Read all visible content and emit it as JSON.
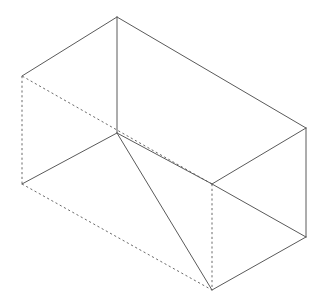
{
  "figure": {
    "background_color": "#ffffff",
    "visible_edge_color": "#5a5a5a",
    "hidden_edge_color": "#6b6b6b",
    "stroke_width": 1,
    "hidden_dash_pattern": "2.2 2.6",
    "canvas": {
      "width": 326,
      "height": 304
    },
    "vertices": {
      "top_back_left": {
        "id": "A",
        "x": 22,
        "y": 76,
        "label": "top-back-left"
      },
      "top_front_left": {
        "id": "B",
        "x": 117,
        "y": 17,
        "label": "top-front-left-apex"
      },
      "top_front_right": {
        "id": "C",
        "x": 306,
        "y": 128,
        "label": "top-front-right"
      },
      "top_back_right": {
        "id": "D",
        "x": 212,
        "y": 184,
        "label": "top-back-right"
      },
      "bot_back_left": {
        "id": "E",
        "x": 22,
        "y": 184,
        "label": "bottom-back-left"
      },
      "bot_front_left": {
        "id": "F",
        "x": 117,
        "y": 133,
        "label": "bottom-front-left"
      },
      "bot_front_right": {
        "id": "G",
        "x": 306,
        "y": 237,
        "label": "bottom-front-right"
      },
      "bot_back_right": {
        "id": "H",
        "x": 212,
        "y": 290,
        "label": "bottom-back-right"
      }
    },
    "edges": [
      {
        "name": "top-back-left-to-apex",
        "from": "A",
        "to": "B",
        "style": "solid",
        "points": "22,76 117,17"
      },
      {
        "name": "apex-to-top-front-right",
        "from": "B",
        "to": "C",
        "style": "solid",
        "points": "117,17 306,128"
      },
      {
        "name": "top-front-right-to-back-right",
        "from": "C",
        "to": "D",
        "style": "solid",
        "points": "306,128 212,184"
      },
      {
        "name": "top-back-right-to-back-left",
        "from": "D",
        "to": "A",
        "style": "hidden",
        "points": "212,184 22,76"
      },
      {
        "name": "apex-to-bottom-front-left",
        "from": "B",
        "to": "F",
        "style": "solid",
        "points": "117,17 117,133"
      },
      {
        "name": "top-back-left-to-bot-back-left",
        "from": "A",
        "to": "E",
        "style": "hidden",
        "points": "22,76 22,184"
      },
      {
        "name": "top-front-right-to-bot-front-right",
        "from": "C",
        "to": "G",
        "style": "solid",
        "points": "306,128 306,237"
      },
      {
        "name": "top-back-right-to-bot-back-right",
        "from": "D",
        "to": "H",
        "style": "hidden",
        "points": "212,184 212,290"
      },
      {
        "name": "bot-back-left-to-bot-front-left",
        "from": "E",
        "to": "F",
        "style": "solid",
        "points": "22,184 117,133"
      },
      {
        "name": "bot-front-left-to-bot-back-right",
        "from": "F",
        "to": "H",
        "style": "solid",
        "points": "117,133 212,290"
      },
      {
        "name": "bot-back-right-to-bot-front-right",
        "from": "H",
        "to": "G",
        "style": "solid",
        "points": "212,290 306,237"
      },
      {
        "name": "bot-front-left-to-top-back-right",
        "from": "F",
        "to": "D",
        "style": "solid",
        "points": "117,133 212,184"
      },
      {
        "name": "bot-back-left-to-bot-back-right",
        "from": "E",
        "to": "H",
        "style": "hidden",
        "points": "22,184 212,290"
      },
      {
        "name": "bot-back-right-diag-hidden",
        "from": "D",
        "to": "G",
        "style": "solid",
        "points": "212,184 306,237"
      }
    ]
  }
}
